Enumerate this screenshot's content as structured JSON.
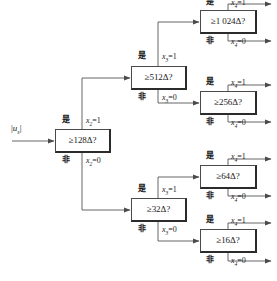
{
  "figure": {
    "type": "binary-search-decision-tree",
    "input_label": "|u_s|",
    "yes_label": "是",
    "no_label": "非"
  },
  "nodes": [
    {
      "id": "n128",
      "label": "≥128Δ?",
      "yes_var": "x",
      "yes_sub": "2",
      "yes_val": "1",
      "no_var": "x",
      "no_sub": "2",
      "no_val": "0"
    },
    {
      "id": "n512",
      "label": "≥512Δ?",
      "yes_var": "x",
      "yes_sub": "3",
      "yes_val": "1",
      "no_var": "x",
      "no_sub": "3",
      "no_val": "0"
    },
    {
      "id": "n32",
      "label": "≥32Δ?",
      "yes_var": "x",
      "yes_sub": "3",
      "yes_val": "1",
      "no_var": "x",
      "no_sub": "3",
      "no_val": "0"
    },
    {
      "id": "n1024",
      "label": "≥1 024Δ?",
      "yes_var": "x",
      "yes_sub": "4",
      "yes_val": "1",
      "no_var": "x",
      "no_sub": "4",
      "no_val": "0"
    },
    {
      "id": "n256",
      "label": "≥256Δ?",
      "yes_var": "x",
      "yes_sub": "4",
      "yes_val": "1",
      "no_var": "x",
      "no_sub": "4",
      "no_val": "0"
    },
    {
      "id": "n64",
      "label": "≥64Δ?",
      "yes_var": "x",
      "yes_sub": "4",
      "yes_val": "1",
      "no_var": "x",
      "no_sub": "4",
      "no_val": "0"
    },
    {
      "id": "n16",
      "label": "≥16Δ?",
      "yes_var": "x",
      "yes_sub": "4",
      "yes_val": "1",
      "no_var": "x",
      "no_sub": "4",
      "no_val": "0"
    }
  ],
  "labels": {
    "yes": "是",
    "no": "非"
  },
  "colors": {
    "box_border": "#4a4a4a",
    "box_shadow": "#2b2b2b",
    "line": "#555555",
    "text": "#1a1a1a",
    "background": "#ffffff"
  }
}
